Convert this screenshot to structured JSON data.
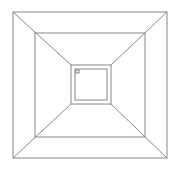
{
  "diagram": {
    "type": "nested-squares-perspective",
    "stroke_color": "#7a7a7a",
    "background": "#ffffff",
    "squares": [
      {
        "name": "outer",
        "x1": 13,
        "y1": 12,
        "x2": 167,
        "y2": 158
      },
      {
        "name": "middle",
        "x1": 35,
        "y1": 33,
        "x2": 145,
        "y2": 137
      },
      {
        "name": "inner",
        "x1": 71,
        "y1": 65,
        "x2": 111,
        "y2": 104
      },
      {
        "name": "innermost",
        "x1": 75,
        "y1": 69,
        "x2": 107,
        "y2": 100
      }
    ],
    "marker": {
      "x": 76,
      "y": 70,
      "size": 3
    }
  }
}
